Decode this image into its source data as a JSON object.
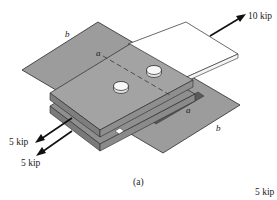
{
  "figure": {
    "caption": "(a)",
    "loads": {
      "applied_right": "10 kip",
      "upper_left": "5 kip",
      "lower_left": "5 kip",
      "bottom_right": "5 kip"
    },
    "section_labels": {
      "a_top": "a",
      "a_bottom": "a",
      "b_top": "b",
      "b_bottom": "b"
    },
    "colors": {
      "plate_gray": "#9a9a9a",
      "plate_gray_dark": "#6e6e6e",
      "plate_edge": "#7d7d7d",
      "white_plate": "#ffffff",
      "outline": "#2a2a2a",
      "arrow": "#111111"
    }
  }
}
